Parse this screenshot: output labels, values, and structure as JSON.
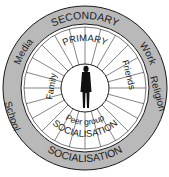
{
  "diagram": {
    "center_figure": "person-silhouette",
    "primary": {
      "top_label": "PRIMARY",
      "bottom_label": "SOCIALISATION",
      "agents": [
        "Family",
        "Friends",
        "Peer group"
      ]
    },
    "secondary": {
      "top_label": "SECONDARY",
      "bottom_label": "SOCIALISATION",
      "agents": [
        "Media",
        "Work",
        "School",
        "Religion"
      ]
    },
    "colors": {
      "outer_ring": "#b9b9b9",
      "inner_ring": "#ffffff",
      "stroke": "#1a1a1a",
      "figure": "#111111"
    }
  }
}
